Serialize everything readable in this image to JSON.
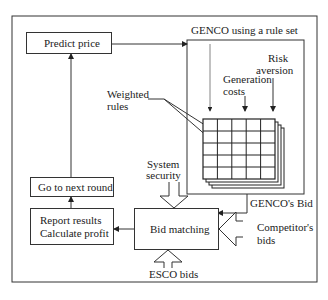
{
  "diagram": {
    "nodes": {
      "predict_price": "Predict price",
      "genco_box_label": "GENCO using a rule set",
      "risk_aversion": [
        "Risk",
        "aversion"
      ],
      "generation_costs": [
        "Generation",
        "costs"
      ],
      "weighted_rules": [
        "Weighted",
        "rules"
      ],
      "system_security": [
        "System",
        "security"
      ],
      "go_next_round": "Go to next round",
      "report_results": [
        "Report results",
        "Calculate profit"
      ],
      "bid_matching": "Bid matching",
      "gencos_bid": "GENCO's Bid",
      "competitors_bids": [
        "Competitor's",
        "bids"
      ],
      "esco_bids": "ESCO bids"
    },
    "edges": [
      {
        "from": "Predict price",
        "to": "GENCO using a rule set"
      },
      {
        "from": "GENCO using a rule set",
        "to": "Bid matching",
        "label": "GENCO's Bid"
      },
      {
        "from": "System security",
        "to": "Bid matching"
      },
      {
        "from": "Competitor's bids",
        "to": "Bid matching"
      },
      {
        "from": "ESCO bids",
        "to": "Bid matching"
      },
      {
        "from": "Bid matching",
        "to": "Report results / Calculate profit"
      },
      {
        "from": "Report results / Calculate profit",
        "to": "Go to next round"
      },
      {
        "from": "Go to next round",
        "to": "Predict price"
      }
    ],
    "grid": {
      "rows": 5,
      "cols": 5,
      "stack_layers": 4
    }
  }
}
